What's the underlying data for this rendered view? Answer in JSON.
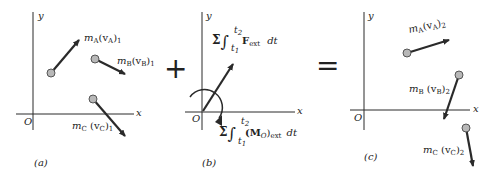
{
  "panels": {
    "a": {
      "caption": "(a)",
      "axis_y": "y",
      "axis_x": "x",
      "origin": "O",
      "momenta": [
        {
          "id": "A",
          "m": "m",
          "msub": "A",
          "v": "(v",
          "vsub": "A",
          "close": ")",
          "idx": "1"
        },
        {
          "id": "B",
          "m": "m",
          "msub": "B",
          "v": "(v",
          "vsub": "B",
          "close": ")",
          "idx": "1"
        },
        {
          "id": "C",
          "m": "m",
          "msub": "C",
          "v": " (v",
          "vsub": "C",
          "close": ")",
          "idx": "1"
        }
      ]
    },
    "b": {
      "caption": "(b)",
      "axis_y": "y",
      "axis_x": "x",
      "origin": "O",
      "impulse_force": {
        "sigma": "Σ",
        "integral": "∫",
        "upper": "t",
        "upper_sub": "2",
        "lower": "t",
        "lower_sub": "1",
        "F": "F",
        "F_sub": "ext",
        "dt": "dt"
      },
      "impulse_moment": {
        "sigma": "Σ",
        "integral": "∫",
        "upper": "t",
        "upper_sub": "2",
        "lower": "t",
        "lower_sub": "1",
        "M": "(M",
        "M_sub": "O",
        "close": ")",
        "ext": "ext",
        "dt": "dt"
      }
    },
    "c": {
      "caption": "(c)",
      "axis_y": "y",
      "axis_x": "x",
      "origin": "O",
      "momenta": [
        {
          "id": "A",
          "m": "m",
          "msub": "A",
          "v": "(v",
          "vsub": "A",
          "close": ")",
          "idx": "2"
        },
        {
          "id": "B",
          "m": "m",
          "msub": "B",
          "v": " (v",
          "vsub": "B",
          "close": ")",
          "idx": "2"
        },
        {
          "id": "C",
          "m": "m",
          "msub": "C",
          "v": " (v",
          "vsub": "C",
          "close": ")",
          "idx": "2"
        }
      ]
    }
  },
  "operators": {
    "plus": "+",
    "equals": "="
  },
  "colors": {
    "line": "#2a2a2a",
    "particle_fill": "#b8b8b8",
    "particle_stroke": "#555555"
  }
}
